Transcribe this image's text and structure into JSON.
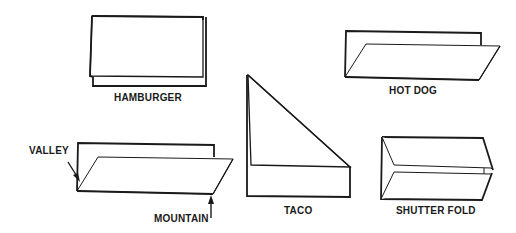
{
  "diagram": {
    "folds": [
      {
        "id": "hamburger",
        "label": "HAMBURGER"
      },
      {
        "id": "hot-dog",
        "label": "HOT DOG"
      },
      {
        "id": "taco",
        "label": "TACO"
      },
      {
        "id": "valley-mountain",
        "label": ""
      },
      {
        "id": "shutter-fold",
        "label": "SHUTTER FOLD"
      }
    ],
    "annotations": {
      "valley": "VALLEY",
      "mountain": "MOUNTAIN"
    },
    "colors": {
      "line": "#1a1a1a",
      "background": "#ffffff"
    }
  }
}
